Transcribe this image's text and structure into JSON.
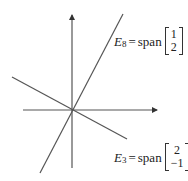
{
  "diagram": {
    "type": "eigenspace-plot",
    "origin": [
      72,
      110
    ],
    "axes": {
      "x_axis": {
        "from": [
          23,
          110
        ],
        "to": [
          157,
          110
        ],
        "arrow": true
      },
      "y_axis": {
        "from": [
          72,
          168
        ],
        "to": [
          72,
          15
        ],
        "arrow": true
      }
    },
    "lines": [
      {
        "name": "E8",
        "from": [
          40,
          173
        ],
        "to": [
          123,
          14
        ],
        "direction": [
          1,
          2
        ],
        "color": "#555555"
      },
      {
        "name": "E3",
        "from": [
          12,
          77
        ],
        "to": [
          127,
          139
        ],
        "direction": [
          2,
          -1
        ],
        "color": "#555555"
      }
    ],
    "colors": {
      "axis": "#555555",
      "line": "#555555",
      "text": "#222222"
    }
  },
  "labels": {
    "e8": {
      "symbol": "E",
      "subscript": "8",
      "equals": "=",
      "span": "span",
      "vector": [
        "1",
        "2"
      ]
    },
    "e3": {
      "symbol": "E",
      "subscript": "3",
      "equals": "=",
      "span": "span",
      "vector": [
        "2",
        "−1"
      ]
    }
  }
}
